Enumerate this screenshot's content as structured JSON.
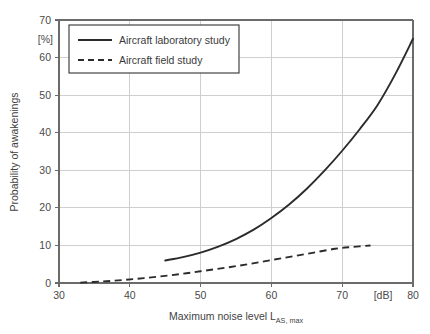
{
  "chart_data": {
    "type": "line",
    "title": "",
    "subtitle": "",
    "xlabel": "Maximum noise level L",
    "xlabel_sub": "AS, max",
    "ylabel": "Probability of awakenings",
    "xunit": "[dB]",
    "yunit": "[%]",
    "xlim": [
      30,
      80
    ],
    "ylim": [
      0,
      70
    ],
    "xticks": [
      30,
      40,
      50,
      60,
      70,
      80
    ],
    "xtick_labels": [
      "30",
      "40",
      "50",
      "60",
      "70",
      "80"
    ],
    "yticks": [
      0,
      10,
      20,
      30,
      40,
      50,
      60,
      70
    ],
    "ytick_labels": [
      "0",
      "10",
      "20",
      "30",
      "40",
      "50",
      "60",
      "70"
    ],
    "grid": true,
    "legend_position": "upper-left-inside",
    "series": [
      {
        "name": "Aircraft laboratory study",
        "style": "solid",
        "color": "#2b2b2b",
        "x": [
          45,
          47.5,
          50,
          52.5,
          55,
          57.5,
          60,
          62.5,
          65,
          67.5,
          70,
          72.5,
          75,
          77.5,
          80
        ],
        "y": [
          6.0,
          6.9,
          8.1,
          9.7,
          11.7,
          14.2,
          17.3,
          20.9,
          25.1,
          29.9,
          35.2,
          41.0,
          47.4,
          55.6,
          65.0
        ]
      },
      {
        "name": "Aircraft field study",
        "style": "dashed",
        "color": "#2b2b2b",
        "x": [
          33,
          36,
          39,
          42,
          45,
          48,
          51,
          54,
          57,
          60,
          63,
          66,
          69,
          71.5,
          74
        ],
        "y": [
          0.1,
          0.4,
          0.8,
          1.3,
          1.9,
          2.6,
          3.4,
          4.2,
          5.1,
          6.1,
          7.1,
          8.1,
          9.1,
          9.6,
          10.0
        ]
      }
    ]
  },
  "legend": {
    "entries": [
      {
        "label": "Aircraft laboratory study",
        "style": "solid"
      },
      {
        "label": "Aircraft field study",
        "style": "dashed"
      }
    ]
  }
}
